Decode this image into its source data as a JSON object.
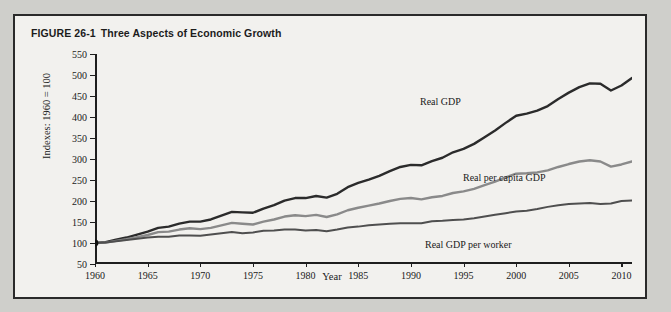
{
  "figure": {
    "number": "FIGURE 26-1",
    "title": "Three Aspects of Economic Growth"
  },
  "axis": {
    "y_title": "Indexes: 1960 = 100",
    "x_title": "Year"
  },
  "colors": {
    "real_gdp": "#2b2b2b",
    "real_per_capita_gdp": "#8a8a8a",
    "real_gdp_per_worker": "#4f4f4f",
    "frame_border": "#2a2a2a",
    "panel_background": "#f2f1ee",
    "page_background": "#cfcfcb"
  },
  "chart_data": {
    "type": "line",
    "title": "Three Aspects of Economic Growth",
    "xlabel": "Year",
    "ylabel": "Indexes: 1960 = 100",
    "xlim": [
      1960,
      2011
    ],
    "ylim": [
      50,
      550
    ],
    "ytick_labels": [
      "50",
      "100",
      "150",
      "200",
      "250",
      "300",
      "350",
      "400",
      "450",
      "500",
      "550"
    ],
    "yticks": [
      50,
      100,
      150,
      200,
      250,
      300,
      350,
      400,
      450,
      500,
      550
    ],
    "xticks": [
      1960,
      1965,
      1970,
      1975,
      1980,
      1985,
      1990,
      1995,
      2000,
      2005,
      2010
    ],
    "xtick_labels": [
      "1960",
      "1965",
      "1970",
      "1975",
      "1980",
      "1985",
      "1990",
      "1995",
      "2000",
      "2005",
      "2010"
    ],
    "grid": false,
    "legend": "inline-labels",
    "x": [
      1960,
      1961,
      1962,
      1963,
      1964,
      1965,
      1966,
      1967,
      1968,
      1969,
      1970,
      1971,
      1972,
      1973,
      1974,
      1975,
      1976,
      1977,
      1978,
      1979,
      1980,
      1981,
      1982,
      1983,
      1984,
      1985,
      1986,
      1987,
      1988,
      1989,
      1990,
      1991,
      1992,
      1993,
      1994,
      1995,
      1996,
      1997,
      1998,
      1999,
      2000,
      2001,
      2002,
      2003,
      2004,
      2005,
      2006,
      2007,
      2008,
      2009,
      2010,
      2011
    ],
    "series": [
      {
        "name": "Real GDP",
        "color": "#2b2b2b",
        "values": [
          100,
          102,
          108,
          113,
          120,
          127,
          136,
          139,
          146,
          151,
          151,
          156,
          165,
          174,
          173,
          172,
          182,
          190,
          201,
          207,
          207,
          212,
          208,
          217,
          233,
          243,
          251,
          260,
          271,
          281,
          286,
          285,
          295,
          303,
          316,
          324,
          336,
          352,
          368,
          386,
          403,
          408,
          415,
          426,
          443,
          458,
          471,
          480,
          479,
          463,
          475,
          493
        ],
        "endpoint_value": 493,
        "peak_value": 480,
        "peak_year": 2007
      },
      {
        "name": "Real per capita GDP",
        "color": "#8a8a8a",
        "values": [
          100,
          101,
          105,
          109,
          114,
          119,
          126,
          127,
          132,
          135,
          133,
          136,
          142,
          148,
          146,
          144,
          151,
          156,
          163,
          166,
          164,
          167,
          162,
          168,
          178,
          184,
          189,
          194,
          200,
          205,
          207,
          204,
          209,
          212,
          219,
          223,
          229,
          238,
          246,
          256,
          265,
          266,
          268,
          273,
          281,
          288,
          294,
          297,
          294,
          282,
          287,
          294
        ],
        "endpoint_value": 294,
        "peak_value": 297,
        "peak_year": 2007
      },
      {
        "name": "Real GDP per worker",
        "color": "#4f4f4f",
        "values": [
          100,
          101,
          104,
          107,
          110,
          113,
          115,
          115,
          118,
          118,
          117,
          120,
          123,
          126,
          123,
          125,
          129,
          130,
          132,
          132,
          130,
          131,
          128,
          132,
          137,
          139,
          142,
          144,
          146,
          147,
          147,
          147,
          152,
          153,
          155,
          156,
          159,
          163,
          167,
          171,
          175,
          177,
          181,
          186,
          190,
          193,
          194,
          195,
          193,
          194,
          200,
          201
        ],
        "endpoint_value": 201,
        "peak_value": 201,
        "peak_year": 2011
      }
    ],
    "annotations": [
      {
        "text": "Real GDP",
        "near_year": 1995
      },
      {
        "text": "Real per capita GDP",
        "near_year": 1998
      },
      {
        "text": "Real GDP per worker",
        "near_year": 1996
      }
    ],
    "origin_marker": {
      "year": 1960,
      "value": 100
    }
  }
}
